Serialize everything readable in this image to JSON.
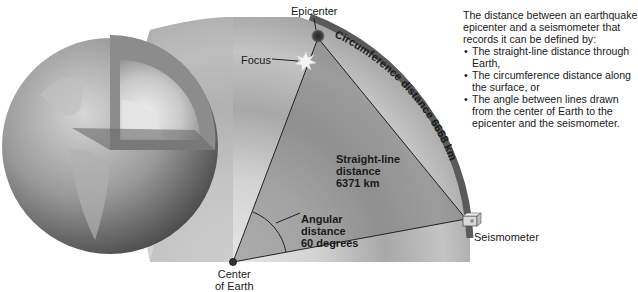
{
  "figure": {
    "labels": {
      "epicenter": "Epicenter",
      "focus": "Focus",
      "circumference": "Circumference distance 6668 km",
      "straight_line": [
        "Straight-line",
        "distance",
        "6371 km"
      ],
      "angular": [
        "Angular",
        "distance",
        "60 degrees"
      ],
      "seismometer": "Seismometer",
      "center": [
        "Center",
        "of Earth"
      ]
    },
    "values": {
      "straight_line_km": 6371,
      "circumference_km": 6668,
      "angle_degrees": 60
    },
    "colors": {
      "background": "#ffffff",
      "crust": "#6e6e6e",
      "mantle_dark": "#8a8a8a",
      "mantle_light": "#bdbdbd",
      "wedge": "#7d7d7d",
      "text": "#1a1a1a"
    }
  },
  "side_text": {
    "intro": "The distance between an earthquake epicenter and a seismometer that records it can be defined by:",
    "bullets": [
      "The straight-line distance through Earth,",
      "The circumference distance along the surface, or",
      "The angle between lines drawn from the center of Earth to the epicenter and the seismometer."
    ]
  }
}
